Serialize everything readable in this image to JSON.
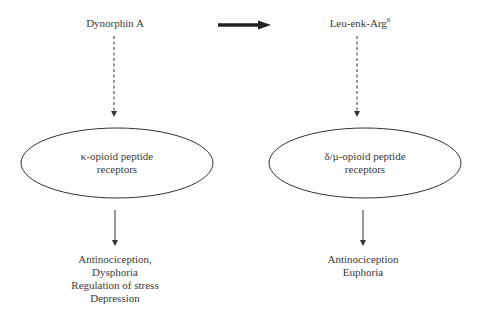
{
  "diagram": {
    "top": {
      "left_precursor": "Dynorphin A",
      "right_product": {
        "base": "Leu-enk-Arg",
        "superscript": "6"
      },
      "conversion_arrow": "thick-right-arrow"
    },
    "receptors": {
      "left": {
        "line1": "κ-opioid peptide",
        "line2": "receptors"
      },
      "right": {
        "line1": "δ/μ-opioid peptide",
        "line2": "receptors"
      }
    },
    "effects": {
      "left": [
        "Antinociception,",
        "Dysphoria",
        "Regulation of stress",
        "Depression"
      ],
      "right": [
        "Antinociception",
        "Euphoria"
      ]
    },
    "connectors": {
      "precursor_to_receptor": "dashed-arrow",
      "receptor_to_effects": "solid-arrow"
    },
    "colors": {
      "text": "#3a3a3a",
      "lines": "#333333",
      "background": "#ffffff"
    }
  }
}
